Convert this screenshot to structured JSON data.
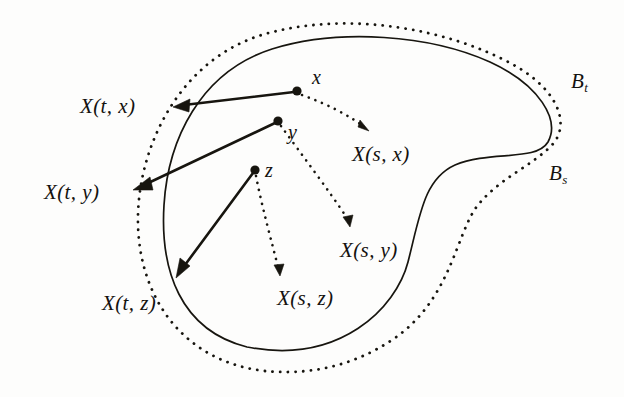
{
  "figure": {
    "kind": "mathematical-diagram",
    "background_color": "#fdfdfc",
    "ink_color": "#17150f"
  },
  "regions": [
    {
      "id": "Bt",
      "label": "B",
      "subscript": "t",
      "stroke_style": "solid",
      "label_x": 571,
      "label_y": 71
    },
    {
      "id": "Bs",
      "label": "B",
      "subscript": "s",
      "stroke_style": "dotted",
      "label_x": 549,
      "label_y": 163
    }
  ],
  "points": [
    {
      "id": "x",
      "label": "x",
      "cx": 297,
      "cy": 91,
      "label_x": 312,
      "label_y": 67
    },
    {
      "id": "y",
      "label": "y",
      "cx": 278,
      "cy": 121,
      "label_x": 288,
      "label_y": 122
    },
    {
      "id": "z",
      "label": "z",
      "cx": 255,
      "cy": 170,
      "label_x": 265,
      "label_y": 160
    }
  ],
  "t_images": [
    {
      "id": "Xtx",
      "label": "X(t, x)",
      "from": "x",
      "label_x": 80,
      "label_y": 96,
      "arrow_tip_x": 173,
      "arrow_tip_y": 107
    },
    {
      "id": "Xty",
      "label": "X(t, y)",
      "from": "y",
      "label_x": 44,
      "label_y": 182,
      "arrow_tip_x": 133,
      "arrow_tip_y": 190
    },
    {
      "id": "Xtz",
      "label": "X(t, z)",
      "from": "z",
      "label_x": 102,
      "label_y": 293,
      "arrow_tip_x": 176,
      "arrow_tip_y": 278
    }
  ],
  "s_images": [
    {
      "id": "Xsx",
      "label": "X(s, x)",
      "from": "x",
      "label_x": 352,
      "label_y": 144,
      "arrow_tip_x": 366,
      "arrow_tip_y": 131
    },
    {
      "id": "Xsy",
      "label": "X(s, y)",
      "from": "y",
      "label_x": 340,
      "label_y": 240,
      "arrow_tip_x": 349,
      "arrow_tip_y": 227
    },
    {
      "id": "Xsz",
      "label": "X(s, z)",
      "from": "z",
      "label_x": 277,
      "label_y": 288,
      "arrow_tip_x": 280,
      "arrow_tip_y": 276
    }
  ]
}
